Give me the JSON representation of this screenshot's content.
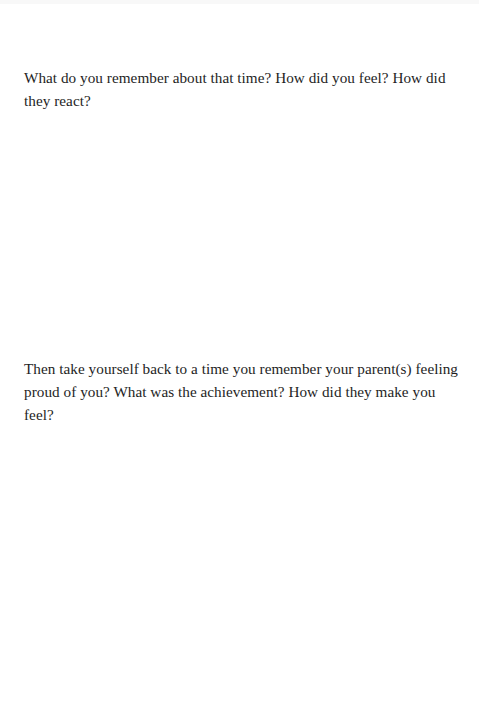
{
  "page": {
    "prompts": [
      {
        "text": "What do you remember about that time? How did you feel? How did they react?"
      },
      {
        "text": "Then take yourself back to a time you remember your parent(s) feeling proud of you? What was the achievement? How did they make you feel?"
      }
    ]
  }
}
